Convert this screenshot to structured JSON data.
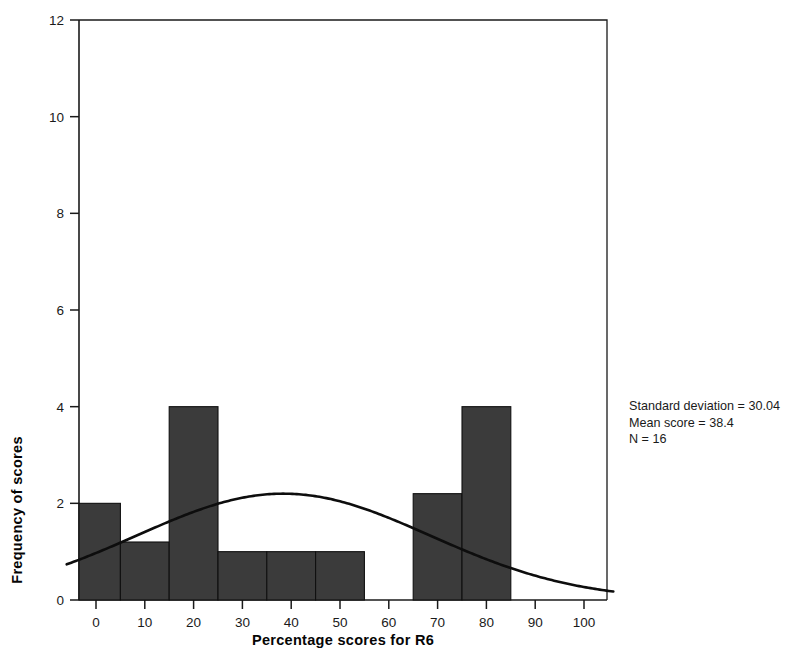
{
  "chart_data": {
    "type": "bar",
    "title": "",
    "subtitle": "",
    "xlabel": "Percentage scores for R6",
    "ylabel": "Frequency of scores",
    "xlim": [
      -10,
      108
    ],
    "ylim": [
      0,
      12
    ],
    "xticks": [
      0,
      10,
      20,
      30,
      40,
      50,
      60,
      70,
      80,
      90,
      100
    ],
    "xtick_labels": [
      "0",
      "10",
      "20",
      "30",
      "40",
      "50",
      "60",
      "70",
      "80",
      "90",
      "100"
    ],
    "yticks": [
      0,
      2,
      4,
      6,
      8,
      10,
      12
    ],
    "ytick_labels": [
      "0",
      "2",
      "4",
      "6",
      "8",
      "10",
      "12"
    ],
    "grid": false,
    "legend": "none",
    "bar_color": "#3b3b3b",
    "bar_edge_color": "#101010",
    "curve_color": "#0d0d0d",
    "bins": [
      {
        "label": "-5 to 5",
        "x_start": -5,
        "x_end": 5,
        "value": 2
      },
      {
        "label": "5 to 15",
        "x_start": 5,
        "x_end": 15,
        "value": 1.2
      },
      {
        "label": "15 to 25",
        "x_start": 15,
        "x_end": 25,
        "value": 4
      },
      {
        "label": "25 to 35",
        "x_start": 25,
        "x_end": 35,
        "value": 1
      },
      {
        "label": "35 to 45",
        "x_start": 35,
        "x_end": 45,
        "value": 1
      },
      {
        "label": "45 to 55",
        "x_start": 45,
        "x_end": 55,
        "value": 1
      },
      {
        "label": "65 to 75",
        "x_start": 65,
        "x_end": 75,
        "value": 2.2
      },
      {
        "label": "75 to 85",
        "x_start": 75,
        "x_end": 85,
        "value": 4
      }
    ],
    "normal_curve": {
      "description": "normal distribution overlay",
      "mean": 38.4,
      "sd": 30.04,
      "peak_value": 2.2,
      "x_start": -6,
      "x_end": 106,
      "y_at_x_start": 0.85,
      "y_at_x_end": 0.02
    }
  },
  "annotations": {
    "std_dev": "Standard deviation = 30.04",
    "mean_score": "Mean score = 38.4",
    "n": "N = 16"
  }
}
